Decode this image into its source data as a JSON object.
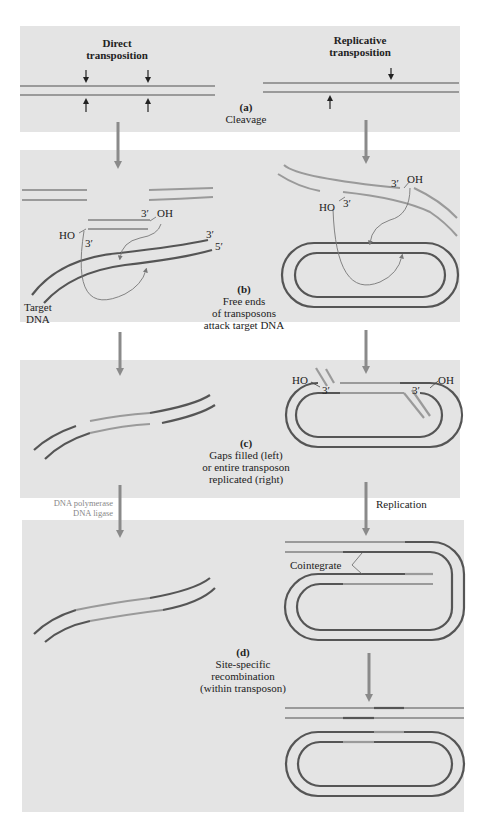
{
  "figure": {
    "columns": {
      "left_title_line1": "Direct",
      "left_title_line2": "transposition",
      "right_title_line1": "Replicative",
      "right_title_line2": "transposition"
    },
    "steps": {
      "a": {
        "tag": "(a)",
        "caption": [
          "Cleavage"
        ]
      },
      "b": {
        "tag": "(b)",
        "caption": [
          "Free ends",
          "of transposons",
          "attack target DNA"
        ]
      },
      "c": {
        "tag": "(c)",
        "caption": [
          "Gaps filled (left)",
          "or entire transposon",
          "replicated (right)"
        ]
      },
      "d": {
        "tag": "(d)",
        "caption": [
          "Site-specific",
          "recombination",
          "(within transposon)"
        ]
      }
    },
    "labels": {
      "three_prime": "3′",
      "five_prime": "5′",
      "oh": "OH",
      "ho": "HO",
      "target_dna_line1": "Target",
      "target_dna_line2": "DNA",
      "cointegrate": "Cointegrate",
      "replication": "Replication",
      "enzymes_line1": "DNA polymerase",
      "enzymes_line2": "DNA ligase"
    },
    "colors": {
      "panel_bg": "#e4e4e4",
      "transposon_strand": "#9a9a9a",
      "target_strand": "#555555",
      "arrow": "#8a8a8a"
    }
  }
}
